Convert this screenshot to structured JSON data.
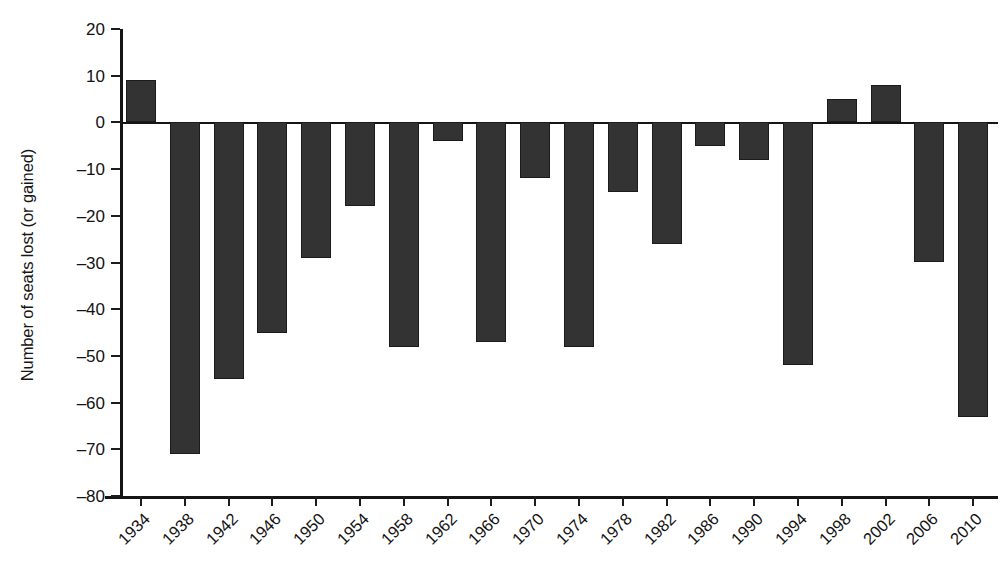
{
  "chart_data": {
    "type": "bar",
    "title": "",
    "subtitle": "",
    "xlabel": "",
    "ylabel": "Number of seats lost (or gained)",
    "categories": [
      "1934",
      "1938",
      "1942",
      "1946",
      "1950",
      "1954",
      "1958",
      "1962",
      "1966",
      "1970",
      "1974",
      "1978",
      "1982",
      "1986",
      "1990",
      "1994",
      "1998",
      "2002",
      "2006",
      "2010"
    ],
    "values": [
      9,
      -71,
      -55,
      -45,
      -29,
      -18,
      -48,
      -4,
      -47,
      -12,
      -48,
      -15,
      -26,
      -5,
      -8,
      -52,
      5,
      8,
      -30,
      -63
    ],
    "series": [
      {
        "name": "Seats lost (or gained)",
        "values": [
          9,
          -71,
          -55,
          -45,
          -29,
          -18,
          -48,
          -4,
          -47,
          -12,
          -48,
          -15,
          -26,
          -5,
          -8,
          -52,
          5,
          8,
          -30,
          -63
        ]
      }
    ],
    "ylim": [
      -80,
      20
    ],
    "xlim_labels": [
      "1934",
      "2010"
    ],
    "y_ticks": [
      20,
      10,
      0,
      -10,
      -20,
      -30,
      -40,
      -50,
      -60,
      -70,
      -80
    ],
    "y_tick_labels": [
      "20",
      "10",
      "0",
      "–10",
      "–20",
      "–30",
      "–40",
      "–50",
      "–60",
      "–70",
      "–80"
    ],
    "grid": false,
    "legend": false,
    "legend_position": "none",
    "bar_color": "#333333",
    "axis_color": "#151515",
    "background_color": "#ffffff",
    "x_tick_rotation": -45,
    "annotations": []
  }
}
